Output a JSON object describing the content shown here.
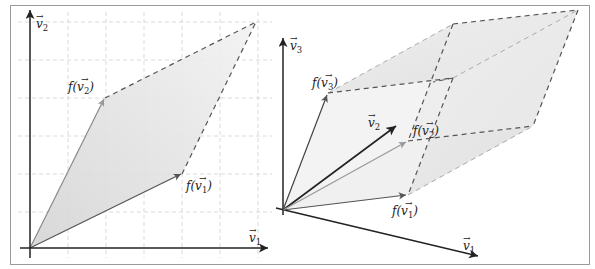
{
  "figure": {
    "left_panel": {
      "axis_x_label": "v1",
      "axis_y_label": "v2",
      "image_v1_label": "f(v1)",
      "image_v2_label": "f(v2)"
    },
    "right_panel": {
      "axis_1_label": "v1",
      "axis_2_label": "v2",
      "axis_3_label": "v3",
      "image_v1_label": "f(v1)",
      "image_v2_label": "f(v2)",
      "image_v3_label": "f(v3)"
    },
    "colors": {
      "axis": "#222222",
      "image_vector": "#555555",
      "image_vector_light": "#999999",
      "fill": "#e6e6e6",
      "fill_dark": "#d6d6d6",
      "grid": "#d0d0d0",
      "dashed_edge": "#555555",
      "frame": "#9a9a9a"
    }
  }
}
